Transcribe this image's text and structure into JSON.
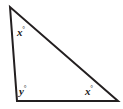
{
  "figure": {
    "name": "triangle-angle-diagram",
    "type": "geometry-diagram",
    "width": 123,
    "height": 109,
    "background_color": "#ffffff",
    "stroke_color": "#231f20",
    "stroke_width": 2,
    "shape": {
      "name": "triangle",
      "vertices": [
        {
          "name": "apex",
          "x": 10,
          "y": 7
        },
        {
          "name": "bottom-left",
          "x": 17,
          "y": 101
        },
        {
          "name": "bottom-right",
          "x": 118,
          "y": 101
        }
      ]
    },
    "labels": {
      "apex_angle": {
        "variable": "x",
        "degree_symbol": "°"
      },
      "bottom_left_angle": {
        "variable": "y",
        "degree_symbol": "°"
      },
      "bottom_right_angle": {
        "variable": "x",
        "degree_symbol": "°"
      }
    }
  }
}
